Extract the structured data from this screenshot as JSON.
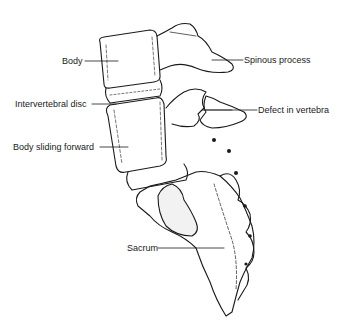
{
  "diagram": {
    "labels": {
      "body": "Body",
      "spinous_process": "Spinous process",
      "intervertebral_disc": "Intervertebral disc",
      "defect_in_vertebra": "Defect in vertebra",
      "body_sliding_forward": "Body sliding forward",
      "sacrum": "Sacrum"
    },
    "colors": {
      "line": "#1a1a1a",
      "background": "#ffffff",
      "shade": "#555555"
    }
  }
}
